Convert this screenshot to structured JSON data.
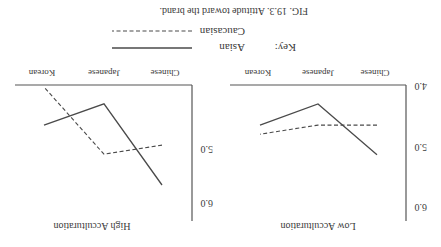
{
  "figure": {
    "caption": "FIG. 19.3.  Attitude toward the brand.",
    "orientation": "rotated 180 degrees",
    "key": {
      "label": "Key:",
      "entries": [
        {
          "name": "Asian",
          "style": "solid"
        },
        {
          "name": "Caucasian",
          "style": "dashed"
        }
      ]
    },
    "colors": {
      "line": "#4a4a4a",
      "axis": "#555555",
      "text": "#3a3a3a"
    }
  },
  "chart_data": [
    {
      "type": "line",
      "title": "Low Acculturation",
      "xlabel": "",
      "ylabel": "",
      "categories": [
        "Chinese",
        "Japanese",
        "Korean"
      ],
      "yticks": [
        "4.0",
        "5.0",
        "6.0"
      ],
      "ylim": [
        4.0,
        6.0
      ],
      "grid": false,
      "series": [
        {
          "name": "Asian",
          "style": "solid",
          "values": [
            5.12,
            4.28,
            4.63
          ]
        },
        {
          "name": "Caucasian",
          "style": "dashed",
          "values": [
            4.63,
            4.63,
            4.78
          ]
        }
      ]
    },
    {
      "type": "line",
      "title": "High Acculturation",
      "xlabel": "",
      "ylabel": "",
      "categories": [
        "Chinese",
        "Japanese",
        "Korean"
      ],
      "yticks": [
        "5.0",
        "6.0"
      ],
      "ylim": [
        4.0,
        6.0
      ],
      "grid": false,
      "series": [
        {
          "name": "Asian",
          "style": "solid",
          "values": [
            5.62,
            4.28,
            4.63
          ]
        },
        {
          "name": "Caucasian",
          "style": "dashed",
          "values": [
            4.96,
            5.11,
            4.0
          ]
        }
      ]
    }
  ]
}
